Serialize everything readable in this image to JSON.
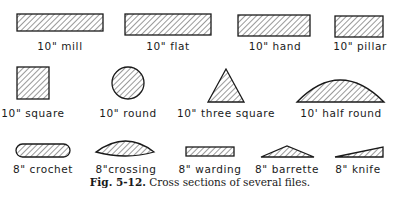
{
  "figure": {
    "caption_label": "Fig. 5-12.",
    "caption_text": " Cross sections of several files.",
    "row1": [
      {
        "label": "10\" mill",
        "shape": "thin-rectangle"
      },
      {
        "label": "10\" flat",
        "shape": "rectangle"
      },
      {
        "label": "10\" hand",
        "shape": "rectangle"
      },
      {
        "label": "10\" pillar",
        "shape": "thick-rectangle"
      }
    ],
    "row2": [
      {
        "label": "10\" square",
        "shape": "square"
      },
      {
        "label": "10\" round",
        "shape": "circle"
      },
      {
        "label": "10\" three square",
        "shape": "triangle"
      },
      {
        "label": "10' half round",
        "shape": "half-round"
      }
    ],
    "row3": [
      {
        "label": "8\" crochet",
        "shape": "rounded-rectangle"
      },
      {
        "label": "8\"crossing",
        "shape": "double-convex"
      },
      {
        "label": "8\" warding",
        "shape": "thin-rectangle"
      },
      {
        "label": "8\" barrette",
        "shape": "flat-triangle"
      },
      {
        "label": "8\" knife",
        "shape": "wedge"
      }
    ]
  }
}
